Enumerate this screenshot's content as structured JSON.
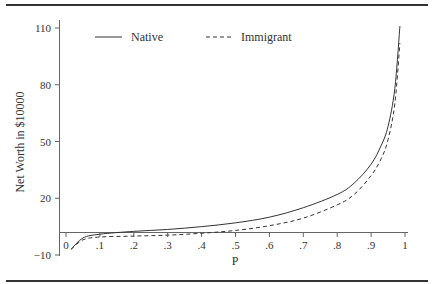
{
  "chart_data": {
    "type": "line",
    "title": "",
    "xlabel": "P",
    "ylabel": "Net Worth in $10000",
    "xlim": [
      0,
      1
    ],
    "ylim": [
      -10,
      110
    ],
    "x_ticks": [
      "0",
      ".1",
      ".2",
      ".3",
      ".4",
      ".5",
      ".6",
      ".7",
      ".8",
      ".9",
      "1"
    ],
    "y_ticks": [
      "-10",
      "20",
      "50",
      "80",
      "110"
    ],
    "grid": false,
    "legend_position": "top-inside",
    "x": [
      0.015,
      0.05,
      0.1,
      0.2,
      0.3,
      0.4,
      0.5,
      0.6,
      0.7,
      0.8,
      0.85,
      0.9,
      0.93,
      0.95,
      0.97,
      0.985
    ],
    "series": [
      {
        "name": "Native",
        "style": "solid",
        "values": [
          -7,
          -1,
          1,
          2.5,
          3.5,
          5,
          7,
          10,
          15,
          22,
          28,
          38,
          48,
          58,
          78,
          111
        ]
      },
      {
        "name": "Immigrant",
        "style": "dashed",
        "values": [
          -7,
          -2,
          -0.5,
          0,
          0.5,
          1.5,
          3,
          5.5,
          9.5,
          16.5,
          22,
          32,
          41,
          51,
          70,
          102
        ]
      }
    ]
  },
  "legend": {
    "native_label": "Native",
    "immigrant_label": "Immigrant"
  },
  "axes": {
    "xlabel": "P",
    "ylabel": "Net Worth in $10000",
    "x_tick_labels": [
      "0",
      ".1",
      ".2",
      ".3",
      ".4",
      ".5",
      ".6",
      ".7",
      ".8",
      ".9",
      "1"
    ],
    "y_tick_labels": [
      "110",
      "80",
      "50",
      "20",
      "−10"
    ]
  }
}
